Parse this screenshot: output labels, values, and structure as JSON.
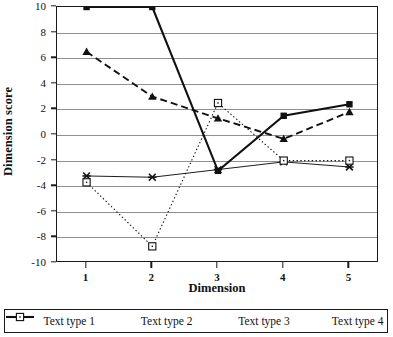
{
  "chart_data": {
    "type": "line",
    "title": "",
    "xlabel": "Dimension",
    "ylabel": "Dimension score",
    "categories": [
      1,
      2,
      3,
      4,
      5
    ],
    "x_tick_labels": [
      "1",
      "2",
      "3",
      "4",
      "5"
    ],
    "y_tick_labels": [
      "-10",
      "-8",
      "-6",
      "-4",
      "-2",
      "0",
      "2",
      "4",
      "6",
      "8",
      "10"
    ],
    "y_ticks": [
      -10,
      -8,
      -6,
      -4,
      -2,
      0,
      2,
      4,
      6,
      8,
      10
    ],
    "ylim": [
      -10,
      10
    ],
    "xlim": [
      0.55,
      5.45
    ],
    "grid": "horizontal",
    "legend_position": "bottom",
    "series": [
      {
        "name": "Text type 1",
        "values": [
          10,
          10,
          -2.8,
          1.5,
          2.4
        ],
        "line_style": "solid",
        "marker": "filled-square",
        "color": "#111111",
        "width": 2.1
      },
      {
        "name": "Text type 2",
        "values": [
          6.5,
          3.0,
          1.3,
          -0.3,
          1.8
        ],
        "line_style": "dashed",
        "marker": "filled-triangle",
        "color": "#111111",
        "width": 1.9
      },
      {
        "name": "Text type 3",
        "values": [
          -3.2,
          -3.3,
          -2.7,
          -2.1,
          -2.5
        ],
        "line_style": "solid",
        "marker": "cross-x",
        "color": "#111111",
        "width": 0.95
      },
      {
        "name": "Text type 4",
        "values": [
          -3.7,
          -8.7,
          2.5,
          -2.0,
          -2.0
        ],
        "line_style": "dotted",
        "marker": "open-square",
        "color": "#111111",
        "width": 1.1
      }
    ]
  }
}
